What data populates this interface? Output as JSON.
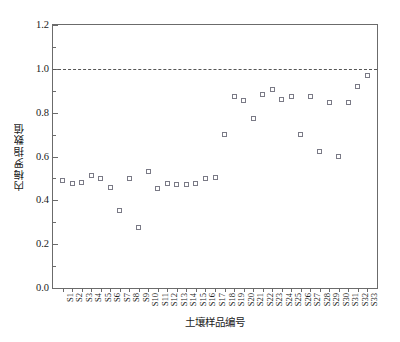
{
  "chart_data": {
    "type": "scatter",
    "title": "",
    "xlabel": "土壤样品编号",
    "ylabel": "内梅罗指数值",
    "xlim": [
      0,
      34
    ],
    "ylim": [
      0.0,
      1.2
    ],
    "grid": false,
    "legend": null,
    "y_ticks": [
      "0.0",
      "0.2",
      "0.4",
      "0.6",
      "0.8",
      "1.0",
      "1.2"
    ],
    "y_tick_values": [
      0.0,
      0.2,
      0.4,
      0.6,
      0.8,
      1.0,
      1.2
    ],
    "y_minor_tick_values": [
      0.1,
      0.3,
      0.5,
      0.7,
      0.9,
      1.1
    ],
    "marker": "open-square",
    "marker_color": "#7a7a86",
    "annotations": [
      {
        "name": "threshold-line",
        "type": "hline",
        "value": 1.0,
        "style": "dashed",
        "color": "#555555"
      }
    ],
    "categories": [
      "S1",
      "S2",
      "S3",
      "S4",
      "S5",
      "S6",
      "S7",
      "S8",
      "S9",
      "S10",
      "S11",
      "S12",
      "S13",
      "S14",
      "S15",
      "S16",
      "S17",
      "S18",
      "S19",
      "S20",
      "S21",
      "S22",
      "S23",
      "S24",
      "S25",
      "S26",
      "S27",
      "S28",
      "S29",
      "S30",
      "S31",
      "S32",
      "S33"
    ],
    "values": [
      0.49,
      0.475,
      0.48,
      0.515,
      0.5,
      0.46,
      0.355,
      0.5,
      0.275,
      0.53,
      0.455,
      0.475,
      0.47,
      0.47,
      0.475,
      0.5,
      0.505,
      0.7,
      0.875,
      0.855,
      0.775,
      0.885,
      0.905,
      0.86,
      0.875,
      0.7,
      0.875,
      0.625,
      0.845,
      0.6,
      0.845,
      0.92,
      0.97
    ]
  }
}
